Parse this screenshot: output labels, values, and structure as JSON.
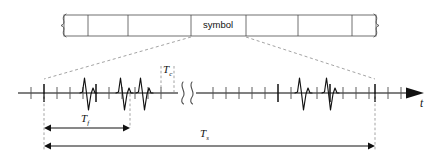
{
  "diagram": {
    "colors": {
      "stroke": "#4d4d4d",
      "axis": "#808080",
      "pulse": "#111111",
      "dash": "#999999",
      "text": "#111111",
      "background": "#ffffff"
    },
    "symbol_stream": {
      "label": "symbol",
      "cell_count": 7,
      "highlighted_cell_index": 3,
      "brace_left": "{",
      "brace_right": "}"
    },
    "axis": {
      "variable_label": "t",
      "arrow": "right-arrow",
      "break_symbol": "waveform-break"
    },
    "measures": [
      {
        "name": "frame-time",
        "symbol": "T",
        "subscript": "f"
      },
      {
        "name": "chip-time",
        "symbol": "T",
        "subscript": "c"
      },
      {
        "name": "symbol-time",
        "symbol": "T",
        "subscript": "s"
      }
    ],
    "pulses": {
      "count": 5,
      "shape": "gaussian-monocycle-doublet",
      "positions": [
        88,
        124,
        178,
        303,
        330
      ]
    },
    "chip_ticks": {
      "minor_count": 26,
      "frame_boundary_count": 4
    }
  }
}
